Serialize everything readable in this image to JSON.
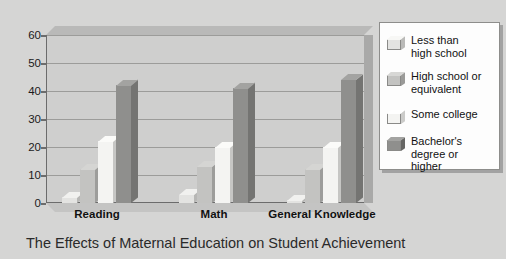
{
  "chart_data": {
    "type": "bar",
    "title": "",
    "caption": "The Effects of Maternal Education on Student Achievement",
    "xlabel": "",
    "ylabel": "",
    "ylim": [
      0,
      60
    ],
    "yticks": [
      0,
      10,
      20,
      30,
      40,
      50,
      60
    ],
    "grid": true,
    "legend_position": "right",
    "categories": [
      "Reading",
      "Math",
      "General Knowledge"
    ],
    "category_labels_display": [
      "Reading",
      "Math",
      "General\nKnowledge"
    ],
    "series": [
      {
        "name": "Less than high school",
        "label_display": "Less than\nhigh school",
        "color": "#e3e3e1",
        "values": [
          2,
          3,
          1
        ]
      },
      {
        "name": "High school or equivalent",
        "label_display": "High school or\nequivalent",
        "color": "#c3c3c1",
        "values": [
          12,
          13,
          12
        ]
      },
      {
        "name": "Some college",
        "label_display": "Some college",
        "color": "#f4f4f2",
        "values": [
          22,
          20,
          20
        ]
      },
      {
        "name": "Bachelor's degree or higher",
        "label_display": "Bachelor's\ndegree or\nhigher",
        "color": "#8f8f8d",
        "values": [
          42,
          41,
          44
        ]
      }
    ]
  },
  "figure": {
    "background_color": "#d5d5d4",
    "plot_background_color": "#cfcfce",
    "axis_color": "#6c6c6c",
    "gridline_color": "#9c9c9a",
    "legend_background_color": "#fdfdfd"
  }
}
